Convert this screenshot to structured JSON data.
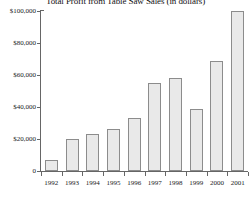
{
  "chart_data": {
    "type": "bar",
    "title": "Total Profit from Table Saw Sales (in dollars)",
    "xlabel": "",
    "ylabel": "",
    "categories": [
      "1992",
      "1993",
      "1994",
      "1995",
      "1996",
      "1997",
      "1998",
      "1999",
      "2000",
      "2001"
    ],
    "values": [
      7000,
      20000,
      23000,
      26000,
      33000,
      55000,
      58000,
      39000,
      69000,
      100000
    ],
    "ylim": [
      0,
      100000
    ],
    "ytick_labels": [
      "$100,000",
      "$80,000",
      "$60,000",
      "$40,000",
      "$20,000",
      "0"
    ],
    "ytick_values": [
      100000,
      80000,
      60000,
      40000,
      20000,
      0
    ],
    "grid": false,
    "legend": null,
    "bar_fill_color": "#e9e9e9",
    "bar_border_color": "#8c8c8c",
    "axis_color": "#666666",
    "background_color": "#ffffff"
  }
}
